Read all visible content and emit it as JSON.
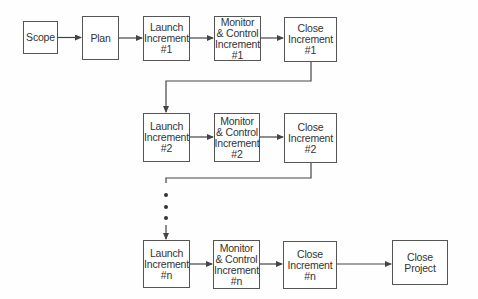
{
  "diagram": {
    "type": "process-flow",
    "boxes": {
      "scope": {
        "lines": [
          "Scope"
        ]
      },
      "plan": {
        "lines": [
          "Plan"
        ]
      },
      "launch1": {
        "lines": [
          "Launch",
          "Increment",
          "#1"
        ]
      },
      "monitor1": {
        "lines": [
          "Monitor",
          "& Control",
          "Increment",
          "#1"
        ]
      },
      "close1": {
        "lines": [
          "Close",
          "Increment",
          "#1"
        ]
      },
      "launch2": {
        "lines": [
          "Launch",
          "Increment",
          "#2"
        ]
      },
      "monitor2": {
        "lines": [
          "Monitor",
          "& Control",
          "Increment",
          "#2"
        ]
      },
      "close2": {
        "lines": [
          "Close",
          "Increment",
          "#2"
        ]
      },
      "launchn": {
        "lines": [
          "Launch",
          "Increment",
          "#n"
        ]
      },
      "monitorn": {
        "lines": [
          "Monitor",
          "& Control",
          "Increment",
          "#n"
        ]
      },
      "closen": {
        "lines": [
          "Close",
          "Increment",
          "#n"
        ]
      },
      "closeproject": {
        "lines": [
          "Close",
          "Project"
        ]
      }
    },
    "edges": [
      [
        "scope",
        "plan"
      ],
      [
        "plan",
        "launch1"
      ],
      [
        "launch1",
        "monitor1"
      ],
      [
        "monitor1",
        "close1"
      ],
      [
        "close1",
        "launch2"
      ],
      [
        "launch2",
        "monitor2"
      ],
      [
        "monitor2",
        "close2"
      ],
      [
        "close2",
        "launchn"
      ],
      [
        "launchn",
        "monitorn"
      ],
      [
        "monitorn",
        "closen"
      ],
      [
        "closen",
        "closeproject"
      ]
    ],
    "ellipsis": "vertical dots between increment #2 and increment #n",
    "colors": {
      "line": "#444444",
      "border": "#555555",
      "text": "#333333"
    }
  }
}
